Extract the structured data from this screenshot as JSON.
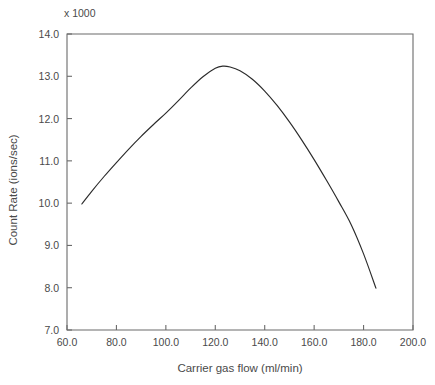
{
  "chart_data": {
    "type": "line",
    "title": "",
    "subtitle": "",
    "multiplier_note": "x 1000",
    "xlabel": "Carrier gas flow (ml/min)",
    "ylabel": "Count Rate (ions/sec)",
    "xlim": [
      60.0,
      200.0
    ],
    "ylim": [
      7.0,
      14.0
    ],
    "xticks": [
      60.0,
      80.0,
      100.0,
      120.0,
      140.0,
      160.0,
      180.0,
      200.0
    ],
    "yticks": [
      7.0,
      8.0,
      9.0,
      10.0,
      11.0,
      12.0,
      13.0,
      14.0
    ],
    "xtick_labels": [
      "60.0",
      "80.0",
      "100.0",
      "120.0",
      "140.0",
      "160.0",
      "180.0",
      "200.0"
    ],
    "ytick_labels": [
      "7.0",
      "8.0",
      "9.0",
      "10.0",
      "11.0",
      "12.0",
      "13.0",
      "14.0"
    ],
    "grid": false,
    "legend": false,
    "legend_position": "none",
    "series": [
      {
        "name": "Count Rate",
        "x": [
          66,
          70,
          75,
          80,
          85,
          90,
          95,
          100,
          105,
          110,
          115,
          120,
          123,
          126,
          130,
          135,
          140,
          145,
          150,
          155,
          160,
          165,
          170,
          175,
          180,
          185
        ],
        "y": [
          9.98,
          10.28,
          10.63,
          10.96,
          11.28,
          11.58,
          11.86,
          12.13,
          12.42,
          12.72,
          12.99,
          13.19,
          13.24,
          13.22,
          13.13,
          12.93,
          12.65,
          12.31,
          11.92,
          11.49,
          11.03,
          10.54,
          10.03,
          9.49,
          8.8,
          7.99
        ]
      }
    ],
    "annotations": []
  }
}
